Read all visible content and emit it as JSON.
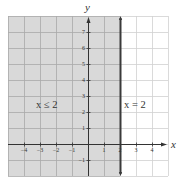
{
  "chart_data": {
    "type": "inequality-graph",
    "title": "",
    "xlabel": "x",
    "ylabel": "y",
    "xlim": [
      -5,
      5
    ],
    "ylim": [
      -2,
      8
    ],
    "grid": true,
    "x_ticks": [
      {
        "value": -4,
        "label": "−4"
      },
      {
        "value": -3,
        "label": "−3"
      },
      {
        "value": -2,
        "label": "−2"
      },
      {
        "value": -1,
        "label": "−1"
      },
      {
        "value": 1,
        "label": "1"
      },
      {
        "value": 2,
        "label": "2"
      },
      {
        "value": 3,
        "label": "3"
      },
      {
        "value": 4,
        "label": "4"
      }
    ],
    "y_ticks": [
      {
        "value": 7,
        "label": "7"
      },
      {
        "value": 6,
        "label": "6"
      },
      {
        "value": 5,
        "label": "5"
      },
      {
        "value": 4,
        "label": "4"
      },
      {
        "value": 3,
        "label": "3"
      },
      {
        "value": 2,
        "label": "2"
      },
      {
        "value": 1,
        "label": "1"
      },
      {
        "value": -1,
        "label": "−1"
      }
    ],
    "boundary_line": {
      "equation": "x = 2",
      "x": 2,
      "style": "solid",
      "label": "x = 2"
    },
    "shaded_region": {
      "inequality": "x ≤ 2",
      "x_from": -5,
      "x_to": 2,
      "label": "x ≤ 2"
    },
    "annotations": [
      {
        "text": "x ≤ 2",
        "x": -3.2,
        "y": 2.6
      },
      {
        "text": "x = 2",
        "x": 3.2,
        "y": 2.6
      }
    ]
  },
  "colors": {
    "shade_fill": "#d9d9d9",
    "grid_shaded": "#a9a9a9",
    "grid_unshaded": "#d0d0d0",
    "axis": "#333333",
    "boundary": "#3a3a3a",
    "background": "#ffffff"
  },
  "labels": {
    "x_axis": "x",
    "y_axis": "y",
    "region": "x ≤ 2",
    "boundary": "x = 2"
  }
}
